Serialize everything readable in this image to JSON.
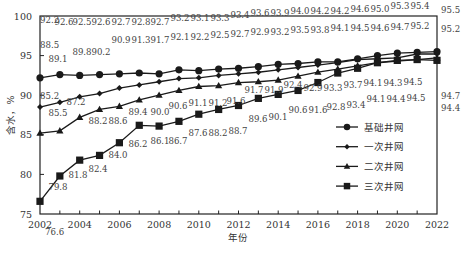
{
  "chart_data": {
    "type": "line",
    "title": "",
    "xlabel": "年份",
    "ylabel": "含水，%",
    "ylim": [
      75,
      100
    ],
    "xlim": [
      2002,
      2022
    ],
    "yticks": [
      75,
      80,
      85,
      90,
      95,
      100
    ],
    "xticks": [
      2002,
      2004,
      2006,
      2008,
      2010,
      2012,
      2014,
      2016,
      2018,
      2020,
      2022
    ],
    "grid": false,
    "legend_position": "inside-right",
    "x": [
      2002,
      2003,
      2004,
      2005,
      2006,
      2007,
      2008,
      2009,
      2010,
      2011,
      2012,
      2013,
      2014,
      2015,
      2016,
      2017,
      2018,
      2019,
      2020,
      2021,
      2022
    ],
    "series": [
      {
        "name": "基础井网",
        "marker": "circle",
        "values": [
          92.2,
          92.6,
          92.5,
          92.6,
          92.7,
          92.8,
          92.7,
          93.2,
          93.1,
          93.3,
          93.4,
          93.6,
          93.9,
          94.0,
          94.2,
          94.2,
          94.6,
          95.0,
          95.3,
          95.4,
          95.5
        ]
      },
      {
        "name": "一次井网",
        "marker": "diamond",
        "values": [
          88.5,
          89.1,
          89.8,
          90.2,
          90.9,
          91.3,
          91.7,
          92.1,
          92.2,
          92.5,
          92.7,
          92.9,
          93.2,
          93.5,
          93.8,
          94.1,
          94.5,
          94.6,
          94.7,
          95.2,
          95.2
        ]
      },
      {
        "name": "二次井网",
        "marker": "triangle",
        "values": [
          85.2,
          85.5,
          87.2,
          88.2,
          88.6,
          89.4,
          90.0,
          90.6,
          91.1,
          91.2,
          91.6,
          91.7,
          91.9,
          92.4,
          92.9,
          93.3,
          93.7,
          94.1,
          94.3,
          94.5,
          94.7
        ]
      },
      {
        "name": "三次井网",
        "marker": "square",
        "values": [
          76.6,
          79.8,
          81.8,
          82.4,
          84.0,
          86.2,
          86.1,
          86.7,
          87.6,
          88.2,
          88.7,
          89.6,
          90.1,
          90.6,
          91.6,
          92.8,
          93.4,
          94.1,
          94.4,
          94.5,
          94.4
        ]
      }
    ]
  },
  "layout": {
    "plot": {
      "left": 40,
      "right": 437,
      "top": 16,
      "bottom": 214
    },
    "line_color": "#1a1a1a",
    "frame_color": "#222222",
    "label_positions": [
      [
        [
          40,
          23
        ],
        [
          64,
          25
        ],
        [
          82,
          25
        ],
        [
          101,
          25
        ],
        [
          121,
          25
        ],
        [
          141,
          25
        ],
        [
          160,
          25
        ],
        [
          180,
          21
        ],
        [
          200,
          21
        ],
        [
          220,
          21
        ],
        [
          240,
          18
        ],
        [
          260,
          16
        ],
        [
          280,
          16
        ],
        [
          300,
          14
        ],
        [
          320,
          14
        ],
        [
          340,
          14
        ],
        [
          360,
          12
        ],
        [
          380,
          12
        ],
        [
          400,
          9
        ],
        [
          420,
          9
        ],
        [
          441,
          13
        ]
      ],
      [
        [
          40,
          48
        ],
        [
          58,
          62
        ],
        [
          82,
          55
        ],
        [
          101,
          55
        ],
        [
          121,
          43
        ],
        [
          141,
          43
        ],
        [
          160,
          43
        ],
        [
          180,
          40
        ],
        [
          200,
          40
        ],
        [
          220,
          38
        ],
        [
          240,
          37
        ],
        [
          260,
          35
        ],
        [
          280,
          35
        ],
        [
          300,
          33
        ],
        [
          320,
          33
        ],
        [
          340,
          31
        ],
        [
          360,
          31
        ],
        [
          380,
          31
        ],
        [
          400,
          30
        ],
        [
          420,
          29
        ],
        [
          441,
          32
        ]
      ],
      [
        [
          40,
          99
        ],
        [
          58,
          116
        ],
        [
          76,
          105
        ],
        [
          98,
          124
        ],
        [
          118,
          124
        ],
        [
          138,
          115
        ],
        [
          160,
          115
        ],
        [
          178,
          109
        ],
        [
          198,
          106
        ],
        [
          218,
          106
        ],
        [
          236,
          104
        ],
        [
          254,
          93
        ],
        [
          274,
          93
        ],
        [
          293,
          88
        ],
        [
          313,
          91
        ],
        [
          333,
          91
        ],
        [
          353,
          88
        ],
        [
          373,
          86
        ],
        [
          393,
          86
        ],
        [
          413,
          85
        ],
        [
          441,
          99
        ]
      ],
      [
        [
          45,
          235
        ],
        [
          58,
          190
        ],
        [
          78,
          178
        ],
        [
          98,
          172
        ],
        [
          118,
          158
        ],
        [
          138,
          147
        ],
        [
          160,
          144
        ],
        [
          178,
          144
        ],
        [
          198,
          136
        ],
        [
          218,
          136
        ],
        [
          238,
          134
        ],
        [
          258,
          122
        ],
        [
          278,
          120
        ],
        [
          298,
          113
        ],
        [
          318,
          113
        ],
        [
          336,
          110
        ],
        [
          356,
          108
        ],
        [
          376,
          102
        ],
        [
          396,
          102
        ],
        [
          416,
          101
        ],
        [
          441,
          111
        ]
      ]
    ],
    "legend": {
      "x": 336,
      "y": 127,
      "spacing": 19.7,
      "line_length": 22,
      "text_offset": 28
    }
  }
}
